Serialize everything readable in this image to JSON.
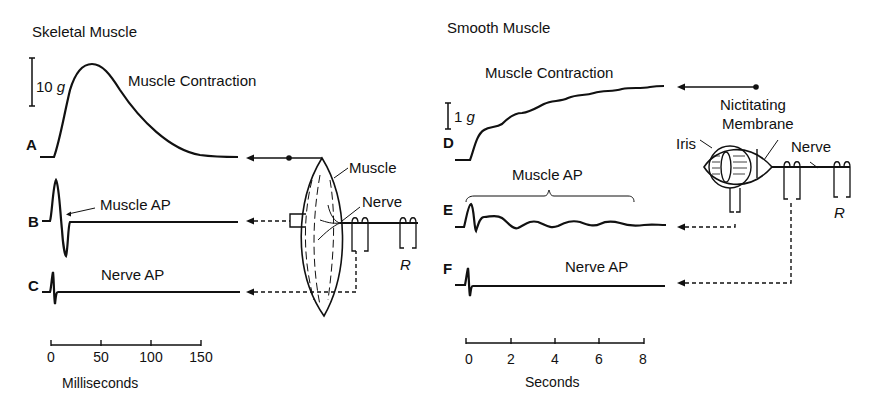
{
  "panels": {
    "skeletal": {
      "title": "Skeletal Muscle",
      "scale_bar": "10 g",
      "traces": [
        {
          "row": "A",
          "label": "Muscle Contraction"
        },
        {
          "row": "B",
          "label": "Muscle AP"
        },
        {
          "row": "C",
          "label": "Nerve AP"
        }
      ],
      "anatomy": {
        "muscle": "Muscle",
        "nerve": "Nerve",
        "stim": "R"
      },
      "axis": {
        "ticks": [
          "0",
          "50",
          "100",
          "150"
        ],
        "label": "Milliseconds"
      }
    },
    "smooth": {
      "title": "Smooth Muscle",
      "scale_bar": "1 g",
      "traces": [
        {
          "row": "D",
          "label": "Muscle Contraction"
        },
        {
          "row": "E",
          "label": "Muscle AP"
        },
        {
          "row": "F",
          "label": "Nerve AP"
        }
      ],
      "anatomy": {
        "nictitating_1": "Nictitating",
        "nictitating_2": "Membrane",
        "iris": "Iris",
        "nerve": "Nerve",
        "stim": "R"
      },
      "axis": {
        "ticks": [
          "0",
          "2",
          "4",
          "6",
          "8"
        ],
        "label": "Seconds"
      }
    }
  },
  "colors": {
    "ink": "#111111",
    "background": "#ffffff"
  }
}
